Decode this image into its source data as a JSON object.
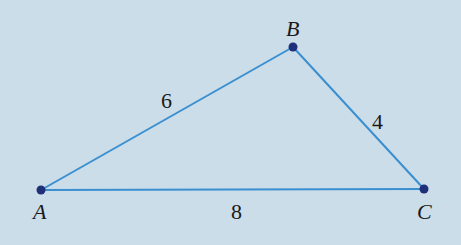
{
  "diagram": {
    "type": "triangle",
    "colors": {
      "background": "#cbdde8",
      "edge": "#3a8fd0",
      "vertex": "#1f2f7a",
      "text": "#1a1a1a"
    },
    "vertices": [
      {
        "label": "A",
        "x": 41,
        "y": 190
      },
      {
        "label": "B",
        "x": 293,
        "y": 47
      },
      {
        "label": "C",
        "x": 424,
        "y": 189
      }
    ],
    "sides": [
      {
        "from": "A",
        "to": "B",
        "length": "6"
      },
      {
        "from": "B",
        "to": "C",
        "length": "4"
      },
      {
        "from": "A",
        "to": "C",
        "length": "8"
      }
    ]
  }
}
